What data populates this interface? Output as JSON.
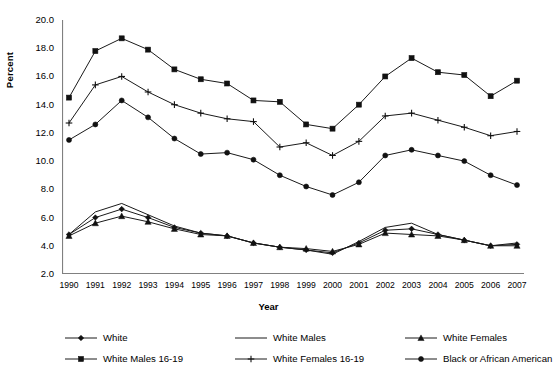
{
  "chart_data": {
    "type": "line",
    "title": "",
    "xlabel": "Year",
    "ylabel": "Percent",
    "grid": false,
    "legend_position": "bottom",
    "x": [
      1990,
      1991,
      1992,
      1993,
      1994,
      1995,
      1996,
      1997,
      1998,
      1999,
      2000,
      2001,
      2002,
      2003,
      2004,
      2005,
      2006,
      2007
    ],
    "categories": [
      "1990",
      "1991",
      "1992",
      "1993",
      "1994",
      "1995",
      "1996",
      "1997",
      "1998",
      "1999",
      "2000",
      "2001",
      "2002",
      "2003",
      "2004",
      "2005",
      "2006",
      "2007"
    ],
    "xlim": [
      1990,
      2007
    ],
    "ylim": [
      2.0,
      20.0
    ],
    "yticks": [
      "2.0",
      "4.0",
      "6.0",
      "8.0",
      "10.0",
      "12.0",
      "14.0",
      "16.0",
      "18.0",
      "20.0"
    ],
    "ytick_values": [
      2.0,
      4.0,
      6.0,
      8.0,
      10.0,
      12.0,
      14.0,
      16.0,
      18.0,
      20.0
    ],
    "series": [
      {
        "name": "White",
        "marker": "diamond",
        "values": [
          4.8,
          6.0,
          6.6,
          6.0,
          5.3,
          4.9,
          4.7,
          4.2,
          3.9,
          3.7,
          3.5,
          4.2,
          5.1,
          5.2,
          4.8,
          4.4,
          4.0,
          4.1
        ]
      },
      {
        "name": "White Males",
        "marker": "none",
        "values": [
          4.8,
          6.4,
          7.0,
          6.2,
          5.4,
          4.9,
          4.7,
          4.2,
          3.9,
          3.7,
          3.4,
          4.3,
          5.3,
          5.6,
          4.8,
          4.4,
          4.0,
          4.2
        ]
      },
      {
        "name": "White Females",
        "marker": "triangle",
        "values": [
          4.7,
          5.6,
          6.1,
          5.7,
          5.2,
          4.8,
          4.7,
          4.2,
          3.9,
          3.8,
          3.6,
          4.1,
          4.9,
          4.8,
          4.7,
          4.4,
          4.0,
          4.0
        ]
      },
      {
        "name": "White Males 16-19",
        "marker": "square",
        "values": [
          14.5,
          17.8,
          18.7,
          17.9,
          16.5,
          15.8,
          15.5,
          14.3,
          14.2,
          12.6,
          12.3,
          14.0,
          16.0,
          17.3,
          16.3,
          16.1,
          14.6,
          15.7
        ]
      },
      {
        "name": "White Females 16-19",
        "marker": "plus",
        "values": [
          12.7,
          15.4,
          16.0,
          14.9,
          14.0,
          13.4,
          13.0,
          12.8,
          11.0,
          11.3,
          10.4,
          11.4,
          13.2,
          13.4,
          12.9,
          12.4,
          11.8,
          12.1
        ]
      },
      {
        "name": "Black or African American",
        "marker": "circle",
        "values": [
          11.5,
          12.6,
          14.3,
          13.1,
          11.6,
          10.5,
          10.6,
          10.1,
          9.0,
          8.2,
          7.6,
          8.5,
          10.4,
          10.8,
          10.4,
          10.0,
          9.0,
          8.3
        ]
      }
    ],
    "colors": {
      "line": "#1a1a1a",
      "marker": "#111111",
      "axis": "#808080",
      "background": "#ffffff"
    }
  }
}
